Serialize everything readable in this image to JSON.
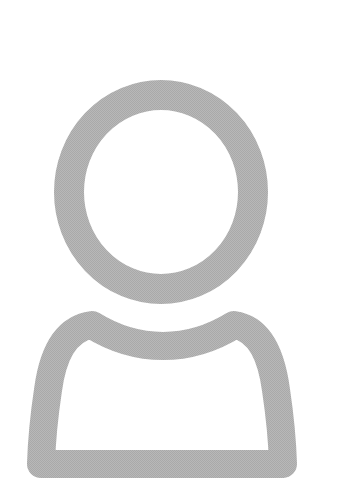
{
  "avatar": {
    "icon": "user-placeholder-icon",
    "stroke_color": "#b3b3b3",
    "background_color": "#ffffff"
  }
}
